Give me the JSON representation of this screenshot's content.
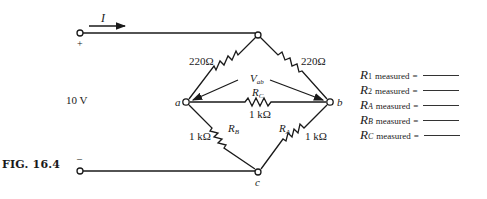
{
  "figure": {
    "caption": "FIG. 16.4",
    "current_label": "I",
    "source_label": "10 V",
    "positive_sign": "+",
    "negative_sign": "–",
    "nodes": {
      "a": "a",
      "b": "b",
      "c": "c"
    },
    "resistors": {
      "R1": {
        "value": "220Ω"
      },
      "R2": {
        "value": "220Ω"
      },
      "RC": {
        "symbol": "R",
        "sub": "C",
        "value": "1 kΩ"
      },
      "RB": {
        "symbol": "R",
        "sub": "B",
        "value": "1 kΩ"
      },
      "RA": {
        "symbol": "R",
        "sub": "A",
        "value": "1 kΩ"
      }
    },
    "voltage_label": {
      "symbol": "V",
      "sub": "ab"
    }
  },
  "measurements": [
    {
      "symbol": "R",
      "sub": "1",
      "italic_sub": false,
      "word": "measured",
      "eq": "="
    },
    {
      "symbol": "R",
      "sub": "2",
      "italic_sub": false,
      "word": "measured",
      "eq": "="
    },
    {
      "symbol": "R",
      "sub": "A",
      "italic_sub": true,
      "word": "measured",
      "eq": "="
    },
    {
      "symbol": "R",
      "sub": "B",
      "italic_sub": true,
      "word": "measured",
      "eq": "="
    },
    {
      "symbol": "R",
      "sub": "C",
      "italic_sub": true,
      "word": "measured",
      "eq": "="
    }
  ]
}
